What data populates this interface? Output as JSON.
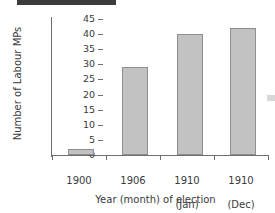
{
  "figure": {
    "title_rule": "",
    "bar_fill_color": "#c2c2c2",
    "bar_border_color": "#8e8e8e",
    "axis_color": "#6e6e6e",
    "text_color": "#3a3a3a"
  },
  "chart_data": {
    "type": "bar",
    "title": "",
    "xlabel": "Year (month) of election",
    "ylabel": "Number of Labour MPs",
    "categories": [
      "1900",
      "1906",
      "1910\n(Jan)",
      "1910\n(Dec)"
    ],
    "category_lines": [
      {
        "year": "1900",
        "month": ""
      },
      {
        "year": "1906",
        "month": ""
      },
      {
        "year": "1910",
        "month": "(Jan)"
      },
      {
        "year": "1910",
        "month": "(Dec)"
      }
    ],
    "values": [
      2,
      29,
      40,
      42
    ],
    "ylim": [
      0,
      45
    ],
    "ytick_labels": [
      "45",
      "40",
      "35",
      "30",
      "25",
      "20",
      "15",
      "10",
      "5",
      "0"
    ],
    "ytick_values": [
      45,
      40,
      35,
      30,
      25,
      20,
      15,
      10,
      5,
      0
    ],
    "ytick_step": 5,
    "grid": false,
    "legend": null,
    "legend_position": "none"
  }
}
